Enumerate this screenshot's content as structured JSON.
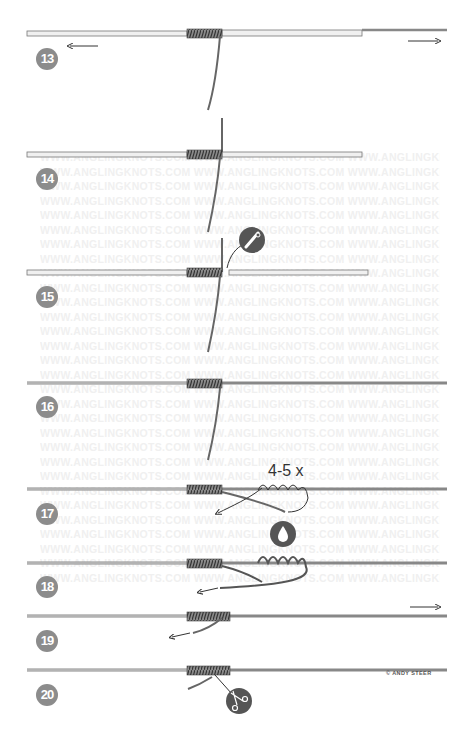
{
  "diagram": {
    "type": "knot-tying-instructions",
    "watermark_text": "WWW.ANGLINGKNOTS.COM WWW.ANGLINGKNOTS.COM WWW.ANGLINGKNOTS.COM",
    "colors": {
      "line": "#7a7a7a",
      "line_light": "#d8d8d8",
      "coil": "#4a4a4a",
      "badge": "#8c8c8c",
      "icon_bg": "#555555"
    },
    "steps": [
      {
        "number": "13",
        "note": "pull both ends apart",
        "arrows": [
          "left",
          "right"
        ]
      },
      {
        "number": "14",
        "note": "tag end vertical through wraps"
      },
      {
        "number": "15",
        "note": "cut tube",
        "icon": "scissors-icon"
      },
      {
        "number": "16",
        "note": "tube removed"
      },
      {
        "number": "17",
        "note": "wrap tag",
        "label": "4-5 x"
      },
      {
        "number": "18",
        "note": "moisten",
        "icon": "water-drop-icon"
      },
      {
        "number": "19",
        "note": "pull tight",
        "arrows": [
          "right"
        ]
      },
      {
        "number": "20",
        "note": "trim tag end",
        "icon": "scissors-icon"
      }
    ],
    "credit": "© ANDY STEER"
  }
}
